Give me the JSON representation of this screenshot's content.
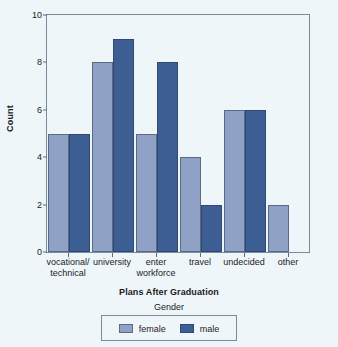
{
  "chart_data": {
    "type": "bar",
    "title": "",
    "xlabel": "Plans After Graduation",
    "ylabel": "Count",
    "categories": [
      "vocational/\ntechnical",
      "university",
      "enter\nworkforce",
      "travel",
      "undecided",
      "other"
    ],
    "series": [
      {
        "name": "female",
        "color": "#8fa2c6",
        "values": [
          5,
          8,
          5,
          4,
          6,
          2
        ]
      },
      {
        "name": "male",
        "color": "#3c5e92",
        "values": [
          5,
          9,
          8,
          2,
          6,
          null
        ]
      }
    ],
    "ylim": [
      0,
      10
    ],
    "yticks": [
      0,
      2,
      4,
      6,
      8,
      10
    ],
    "ytick_labels": [
      "0",
      "2",
      "4",
      "6",
      "8",
      "10"
    ],
    "grid": false,
    "legend": {
      "title": "Gender",
      "position": "bottom",
      "entries": [
        "female",
        "male"
      ]
    }
  },
  "colors": {
    "background": "#eef6fa",
    "frame": "#7c8a9b",
    "female": "#8fa2c6",
    "male": "#3c5e92",
    "text": "#1b1b1b"
  }
}
